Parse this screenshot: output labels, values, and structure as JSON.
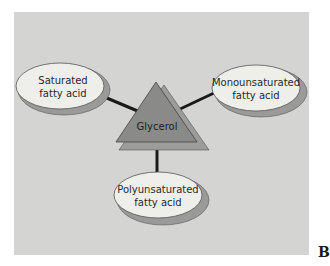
{
  "diagram": {
    "center": {
      "label": "Glycerol",
      "shape": "triangle",
      "fill": "#8a8a88",
      "shadow": "#9c9c9a"
    },
    "nodes": [
      {
        "id": "saturated",
        "line1": "Saturated",
        "line2": "fatty acid"
      },
      {
        "id": "monounsaturated",
        "line1": "Monounsaturated",
        "line2": "fatty acid"
      },
      {
        "id": "polyunsaturated",
        "line1": "Polyunsaturated",
        "line2": "fatty acid"
      }
    ],
    "colors": {
      "panel": "#d4d4d2",
      "ellipse_fill": "#eeeeea",
      "ellipse_shadow": "#9a9a98",
      "connector": "#1a1a1a"
    }
  },
  "figure_letter": "B"
}
